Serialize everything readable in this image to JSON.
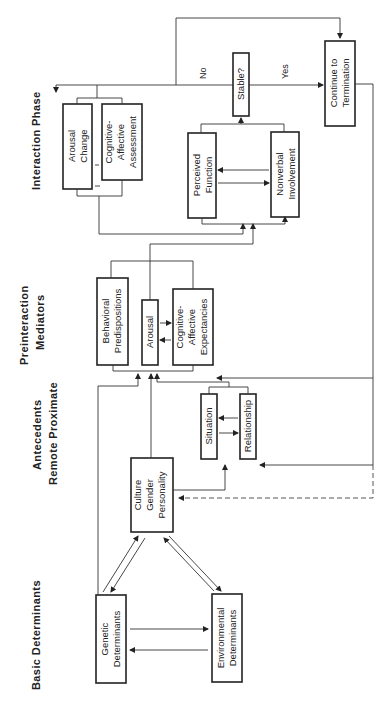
{
  "headers": {
    "basic": "Basic Determinants",
    "antecedents": "Antecedents",
    "remote_proximate": "Remote   Proximate",
    "preinteraction_1": "Preinteraction",
    "preinteraction_2": "Mediators",
    "interaction": "Interaction Phase"
  },
  "boxes": {
    "genetic": [
      "Genetic",
      "Determinants"
    ],
    "environmental": [
      "Environmental",
      "Determinants"
    ],
    "culture": [
      "Culture",
      "Gender",
      "Personality"
    ],
    "situation": [
      "Situation"
    ],
    "relationship": [
      "Relationship"
    ],
    "behavioral": [
      "Behavioral",
      "Predispositions"
    ],
    "arousal": [
      "Arousal"
    ],
    "expectancies": [
      "Cognitive-",
      "Affective",
      "Expectancies"
    ],
    "arousal_change": [
      "Arousal",
      "Change"
    ],
    "assessment": [
      "Cognitive-",
      "Affective",
      "Assessment"
    ],
    "perceived": [
      "Perceived",
      "Function"
    ],
    "nonverbal": [
      "Nonverbal",
      "Involvement"
    ],
    "stable": [
      "Stable?"
    ],
    "continue": [
      "Continue to",
      "Termination"
    ]
  },
  "edges": {
    "no": "No",
    "yes": "Yes"
  }
}
